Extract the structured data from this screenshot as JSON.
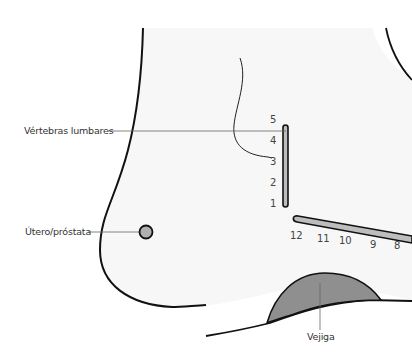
{
  "diagram": {
    "colors": {
      "body_fill": "#f7f7f7",
      "outline": "#111111",
      "leader": "#666666",
      "organ_fill": "#8f8f8f",
      "vertebra_fill": "#bdbdbd",
      "uterus_fill": "#b0b0b0"
    },
    "labels": {
      "lumbar": "Vértebras lumbares",
      "uterus": "Útero/próstata",
      "bladder": "Vejiga"
    },
    "vertebra_numbers": [
      "5",
      "4",
      "3",
      "2",
      "1"
    ],
    "rib_numbers": [
      "12",
      "11",
      "10",
      "9",
      "8"
    ]
  }
}
